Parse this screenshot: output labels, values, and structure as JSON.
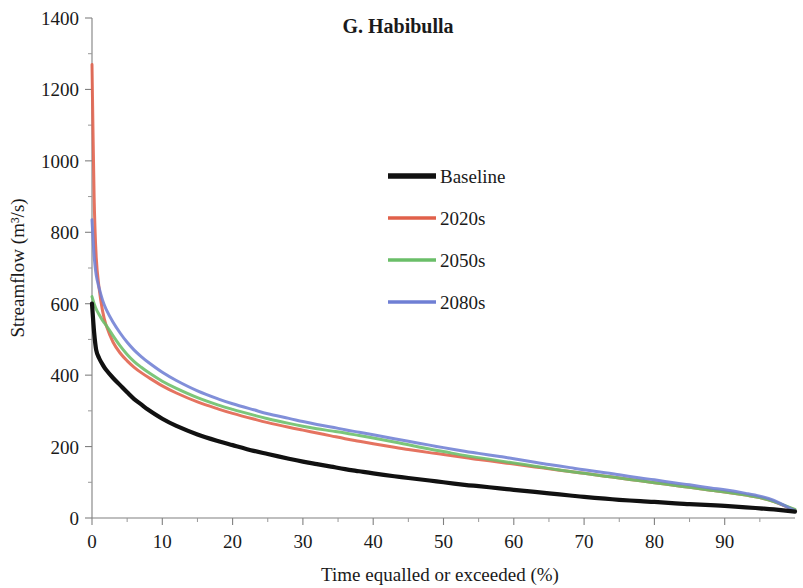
{
  "chart_data": {
    "type": "line",
    "title": "G. Habibulla",
    "xlabel": "Time equalled or exceeded (%)",
    "ylabel": "Streamflow (m³/s)",
    "xlim": [
      0,
      100
    ],
    "ylim": [
      0,
      1400
    ],
    "xticks": [
      0,
      10,
      20,
      30,
      40,
      50,
      60,
      70,
      80,
      90
    ],
    "xtick_labels": [
      "0",
      "10",
      "20",
      "30",
      "40",
      "50",
      "60",
      "70",
      "80",
      "90"
    ],
    "x_minor_step": 5,
    "yticks": [
      0,
      200,
      400,
      600,
      800,
      1000,
      1200,
      1400
    ],
    "ytick_labels": [
      "0",
      "200",
      "400",
      "600",
      "800",
      "1000",
      "1200",
      "1400"
    ],
    "grid": false,
    "legend_position": "upper-center-right",
    "x": [
      0,
      0.3,
      0.6,
      1,
      1.5,
      2,
      3,
      4,
      5,
      6,
      7,
      8,
      10,
      12,
      15,
      18,
      20,
      23,
      25,
      28,
      30,
      32,
      34,
      36,
      38,
      40,
      43,
      45,
      48,
      50,
      53,
      55,
      58,
      60,
      63,
      65,
      68,
      70,
      73,
      75,
      78,
      80,
      83,
      85,
      88,
      90,
      93,
      95,
      97,
      100
    ],
    "series": [
      {
        "name": "Baseline",
        "color": "#111111",
        "width": 4.2,
        "values": [
          600,
          520,
          470,
          448,
          430,
          415,
          392,
          372,
          352,
          333,
          318,
          303,
          278,
          258,
          234,
          215,
          204,
          188,
          179,
          166,
          158,
          151,
          144,
          137,
          131,
          125,
          117,
          112,
          105,
          100,
          93,
          89,
          83,
          79,
          73,
          69,
          63,
          59,
          54,
          51,
          47,
          45,
          41,
          39,
          36,
          34,
          30,
          27,
          24,
          18
        ]
      },
      {
        "name": "2020s",
        "color": "#E1604A",
        "width": 3.0,
        "values": [
          1270,
          900,
          730,
          645,
          580,
          540,
          492,
          462,
          440,
          422,
          407,
          394,
          370,
          350,
          325,
          305,
          293,
          277,
          267,
          254,
          246,
          238,
          230,
          222,
          215,
          208,
          198,
          192,
          183,
          178,
          169,
          164,
          156,
          151,
          143,
          138,
          130,
          125,
          117,
          112,
          104,
          99,
          91,
          86,
          78,
          73,
          64,
          57,
          46,
          22
        ]
      },
      {
        "name": "2050s",
        "color": "#6ABE68",
        "width": 3.0,
        "values": [
          620,
          600,
          585,
          570,
          553,
          540,
          510,
          482,
          458,
          438,
          422,
          408,
          383,
          363,
          337,
          316,
          304,
          288,
          278,
          265,
          257,
          250,
          244,
          238,
          231,
          224,
          213,
          205,
          193,
          186,
          175,
          169,
          160,
          154,
          145,
          139,
          130,
          125,
          117,
          112,
          104,
          99,
          91,
          86,
          78,
          73,
          64,
          57,
          46,
          24
        ]
      },
      {
        "name": "2080s",
        "color": "#6F7FD4",
        "width": 3.0,
        "values": [
          835,
          735,
          680,
          645,
          610,
          585,
          548,
          518,
          492,
          470,
          452,
          436,
          408,
          385,
          356,
          333,
          320,
          303,
          292,
          279,
          270,
          262,
          255,
          247,
          240,
          233,
          222,
          215,
          204,
          197,
          187,
          181,
          172,
          166,
          156,
          150,
          141,
          135,
          127,
          121,
          112,
          107,
          98,
          93,
          84,
          79,
          69,
          61,
          49,
          20
        ]
      }
    ]
  },
  "legend": {
    "entries": [
      {
        "label": "Baseline",
        "color": "#111111"
      },
      {
        "label": "2020s",
        "color": "#E1604A"
      },
      {
        "label": "2050s",
        "color": "#6ABE68"
      },
      {
        "label": "2080s",
        "color": "#6F7FD4"
      }
    ]
  }
}
